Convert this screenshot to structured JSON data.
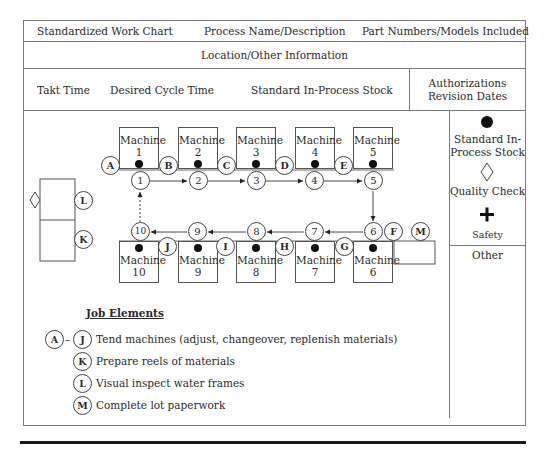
{
  "header": {
    "row1": {
      "title": "Standardized Work Chart",
      "process": "Process Name/Description",
      "parts": "Part Numbers/Models Included"
    },
    "row2": {
      "location": "Location/Other Information"
    },
    "row3": {
      "takt": "Takt Time",
      "cycle": "Desired Cycle Time",
      "stock": "Standard In-Process Stock",
      "auth_line1": "Authorizations",
      "auth_line2": "Revision Dates"
    }
  },
  "legend": {
    "stock_line1": "Standard In-",
    "stock_line2": "Process Stock",
    "quality": "Quality Check",
    "safety": "Safety",
    "other": "Other",
    "colors": {
      "stock_dot": "#111111",
      "lines": "#7a7a7a"
    }
  },
  "machines": {
    "m1": {
      "label": "Machine",
      "num": "1"
    },
    "m2": {
      "label": "Machine",
      "num": "2"
    },
    "m3": {
      "label": "Machine",
      "num": "3"
    },
    "m4": {
      "label": "Machine",
      "num": "4"
    },
    "m5": {
      "label": "Machine",
      "num": "5"
    },
    "m6": {
      "label": "Machine",
      "num": "6"
    },
    "m7": {
      "label": "Machine",
      "num": "7"
    },
    "m8": {
      "label": "Machine",
      "num": "8"
    },
    "m9": {
      "label": "Machine",
      "num": "9"
    },
    "m10": {
      "label": "Machine",
      "num": "10"
    }
  },
  "steps": [
    "1",
    "2",
    "3",
    "4",
    "5",
    "6",
    "7",
    "8",
    "9",
    "10"
  ],
  "elements": {
    "A": "A",
    "B": "B",
    "C": "C",
    "D": "D",
    "E": "E",
    "F": "F",
    "G": "G",
    "H": "H",
    "I": "I",
    "J": "J",
    "K": "K",
    "L": "L",
    "M": "M"
  },
  "job_elements": {
    "heading": "Job Elements",
    "dash": "–",
    "items": [
      {
        "from": "A",
        "to": "J",
        "text": "Tend machines (adjust, changeover, replenish materials)"
      },
      {
        "code": "K",
        "text": "Prepare reels of materials"
      },
      {
        "code": "L",
        "text": "Visual inspect water frames"
      },
      {
        "code": "M",
        "text": "Complete lot paperwork"
      }
    ]
  }
}
